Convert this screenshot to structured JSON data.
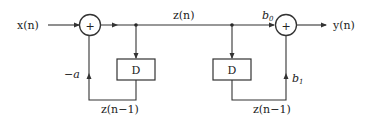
{
  "diagram": {
    "type": "signal-flow",
    "labels": {
      "input": "x(n)",
      "output": "y(n)",
      "state": "z(n)",
      "delay1": "D",
      "delay2": "D",
      "delayed1": "z(n−1)",
      "delayed2": "z(n−1)",
      "coef_feedback": "−a",
      "coef_b0": "b",
      "coef_b0_sub": "0",
      "coef_b1": "b",
      "coef_b1_sub": "1",
      "adder1": "+",
      "adder2": "+"
    }
  }
}
